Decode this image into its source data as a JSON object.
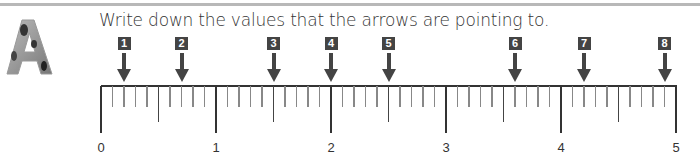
{
  "exercise": {
    "letter": "A",
    "instruction": "Write down the values that the arrows are pointing to."
  },
  "number_line": {
    "min": 0,
    "max": 5,
    "major_labels": [
      "0",
      "1",
      "2",
      "3",
      "4",
      "5"
    ],
    "subdivisions_per_unit": 10,
    "arrows": [
      {
        "label": "1",
        "value": 0.2
      },
      {
        "label": "2",
        "value": 0.7
      },
      {
        "label": "3",
        "value": 1.5
      },
      {
        "label": "4",
        "value": 2.0
      },
      {
        "label": "5",
        "value": 2.5
      },
      {
        "label": "6",
        "value": 3.6
      },
      {
        "label": "7",
        "value": 4.2
      },
      {
        "label": "8",
        "value": 4.9
      }
    ]
  },
  "colors": {
    "ink": "#333333",
    "badge": "#444444",
    "minor_tick": "#888888",
    "rule": "#b8b8b8"
  }
}
